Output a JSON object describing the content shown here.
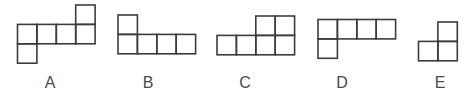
{
  "style": {
    "stroke": "#3c3c3c",
    "stroke_width": 1.6,
    "cell_size": 19.4
  },
  "figures": [
    {
      "label": "A",
      "label_x": 50,
      "origin": [
        17.5,
        5
      ],
      "cells": [
        [
          3,
          0
        ],
        [
          0,
          1
        ],
        [
          1,
          1
        ],
        [
          2,
          1
        ],
        [
          3,
          1
        ],
        [
          0,
          2
        ]
      ]
    },
    {
      "label": "B",
      "label_x": 148,
      "origin": [
        118,
        15
      ],
      "cells": [
        [
          0,
          0
        ],
        [
          0,
          1
        ],
        [
          1,
          1
        ],
        [
          2,
          1
        ],
        [
          3,
          1
        ]
      ]
    },
    {
      "label": "C",
      "label_x": 245,
      "origin": [
        217,
        16
      ],
      "cells": [
        [
          2,
          0
        ],
        [
          3,
          0
        ],
        [
          0,
          1
        ],
        [
          1,
          1
        ],
        [
          2,
          1
        ],
        [
          3,
          1
        ]
      ]
    },
    {
      "label": "D",
      "label_x": 342,
      "origin": [
        318,
        19.5
      ],
      "cells": [
        [
          0,
          0
        ],
        [
          1,
          0
        ],
        [
          2,
          0
        ],
        [
          3,
          0
        ],
        [
          0,
          1
        ]
      ]
    },
    {
      "label": "E",
      "label_x": 440,
      "origin": [
        418.5,
        22
      ],
      "cells": [
        [
          1,
          0
        ],
        [
          0,
          1
        ],
        [
          1,
          1
        ]
      ]
    }
  ]
}
